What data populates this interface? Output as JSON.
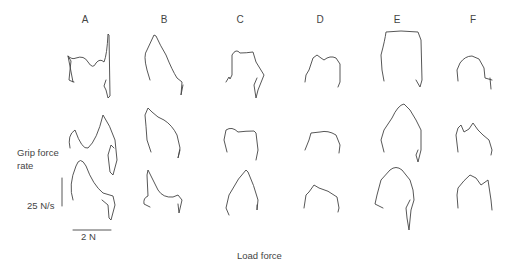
{
  "figure": {
    "columns": [
      {
        "label": "A",
        "x": 85
      },
      {
        "label": "B",
        "x": 164
      },
      {
        "label": "C",
        "x": 240
      },
      {
        "label": "D",
        "x": 320
      },
      {
        "label": "E",
        "x": 397
      },
      {
        "label": "F",
        "x": 473
      }
    ],
    "y_axis_label_line1": "Grip force",
    "y_axis_label_line2": "rate",
    "scale_bar_vertical": "25 N/s",
    "scale_bar_horizontal": "2 N",
    "x_axis_label": "Load force",
    "rows": 3
  }
}
